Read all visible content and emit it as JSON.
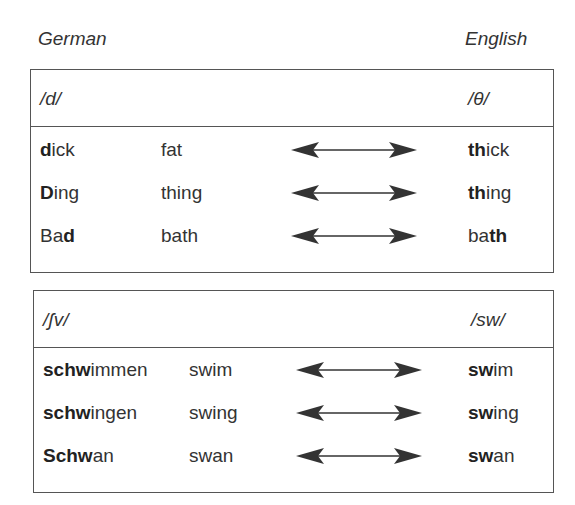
{
  "columns": {
    "left_label": "German",
    "right_label": "English"
  },
  "groups": [
    {
      "left_phoneme": "/d/",
      "right_phoneme": "/θ/",
      "rows": [
        {
          "german": [
            {
              "t": "d",
              "b": true
            },
            {
              "t": "ick",
              "b": false
            }
          ],
          "gloss": "fat",
          "english": [
            {
              "t": "th",
              "b": true
            },
            {
              "t": "ick",
              "b": false
            }
          ]
        },
        {
          "german": [
            {
              "t": "D",
              "b": true
            },
            {
              "t": "ing",
              "b": false
            }
          ],
          "gloss": "thing",
          "english": [
            {
              "t": "th",
              "b": true
            },
            {
              "t": "ing",
              "b": false
            }
          ]
        },
        {
          "german": [
            {
              "t": "Ba",
              "b": false
            },
            {
              "t": "d",
              "b": true
            }
          ],
          "gloss": "bath",
          "english": [
            {
              "t": "ba",
              "b": false
            },
            {
              "t": "th",
              "b": true
            }
          ]
        }
      ]
    },
    {
      "left_phoneme": "/ʃv/",
      "right_phoneme": "/sw/",
      "rows": [
        {
          "german": [
            {
              "t": "schw",
              "b": true
            },
            {
              "t": "immen",
              "b": false
            }
          ],
          "gloss": "swim",
          "english": [
            {
              "t": "sw",
              "b": true
            },
            {
              "t": "im",
              "b": false
            }
          ]
        },
        {
          "german": [
            {
              "t": "schw",
              "b": true
            },
            {
              "t": "ingen",
              "b": false
            }
          ],
          "gloss": "swing",
          "english": [
            {
              "t": "sw",
              "b": true
            },
            {
              "t": "ing",
              "b": false
            }
          ]
        },
        {
          "german": [
            {
              "t": "Schw",
              "b": true
            },
            {
              "t": "an",
              "b": false
            }
          ],
          "gloss": "swan",
          "english": [
            {
              "t": "sw",
              "b": true
            },
            {
              "t": "an",
              "b": false
            }
          ]
        }
      ]
    }
  ],
  "icons": {
    "arrow": "double-headed-arrow-icon"
  },
  "colors": {
    "text": "#333333",
    "border": "#555555",
    "arrow": "#333333"
  }
}
